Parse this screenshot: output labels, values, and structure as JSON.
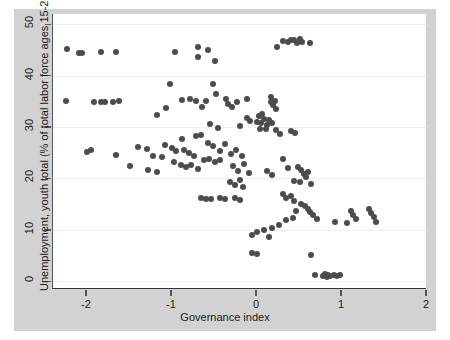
{
  "chart_data": {
    "type": "scatter",
    "title": "",
    "xlabel": "Governance index",
    "ylabel": "Unemployment, youth total (% of total labor force ages 15-24)",
    "xlim": [
      -2.4,
      2.0
    ],
    "ylim": [
      -1.5,
      52.0
    ],
    "xticks": [
      -2,
      -1,
      0,
      1,
      2
    ],
    "xtick_labels": [
      "-2",
      "-1",
      "0",
      "1",
      "2"
    ],
    "yticks": [
      0,
      10,
      20,
      30,
      40,
      50
    ],
    "ytick_labels": [
      "0",
      "10",
      "20",
      "30",
      "40",
      "50"
    ],
    "grid": "horizontal-faint",
    "legend": "none",
    "marker_color": "#4c4c4c",
    "marker_size": 6,
    "plot_background": "#ffffff",
    "figure_background": "#d2d2d2",
    "points": [
      [
        -2.23,
        45.2
      ],
      [
        -2.1,
        44.5
      ],
      [
        -2.06,
        44.4
      ],
      [
        -1.84,
        44.6
      ],
      [
        -1.66,
        44.6
      ],
      [
        -0.96,
        44.7
      ],
      [
        -0.69,
        45.6
      ],
      [
        -0.7,
        43.6
      ],
      [
        -0.58,
        44.9
      ],
      [
        -0.5,
        42.8
      ],
      [
        0.3,
        46.8
      ],
      [
        0.36,
        46.5
      ],
      [
        0.4,
        46.9
      ],
      [
        0.44,
        47.0
      ],
      [
        0.47,
        46.4
      ],
      [
        0.5,
        47.2
      ],
      [
        0.53,
        46.6
      ],
      [
        0.24,
        45.6
      ],
      [
        0.62,
        46.4
      ],
      [
        -1.02,
        38.4
      ],
      [
        -0.52,
        38.3
      ],
      [
        -0.48,
        36.4
      ],
      [
        -2.25,
        35.0
      ],
      [
        -1.92,
        34.9
      ],
      [
        -1.84,
        34.9
      ],
      [
        -1.79,
        34.9
      ],
      [
        -1.7,
        34.9
      ],
      [
        -1.07,
        33.8
      ],
      [
        -0.88,
        35.2
      ],
      [
        -0.79,
        35.5
      ],
      [
        -0.72,
        35.1
      ],
      [
        -0.36,
        35.4
      ],
      [
        -0.34,
        34.5
      ],
      [
        -0.3,
        34.0
      ],
      [
        -0.23,
        34.8
      ],
      [
        -0.12,
        35.4
      ],
      [
        -0.6,
        35.0
      ],
      [
        -0.65,
        34.0
      ],
      [
        0.16,
        35.8
      ],
      [
        0.17,
        34.9
      ],
      [
        0.19,
        34.2
      ],
      [
        0.21,
        35.0
      ],
      [
        0.22,
        33.6
      ],
      [
        -1.18,
        32.3
      ],
      [
        -0.55,
        30.6
      ],
      [
        -0.2,
        30.2
      ],
      [
        0.03,
        29.6
      ],
      [
        0.4,
        29.2
      ],
      [
        -0.12,
        31.7
      ],
      [
        -0.08,
        31.2
      ],
      [
        0.0,
        31.0
      ],
      [
        0.05,
        30.8
      ],
      [
        0.08,
        31.6
      ],
      [
        0.12,
        30.5
      ],
      [
        0.14,
        31.4
      ],
      [
        0.18,
        30.8
      ],
      [
        0.06,
        32.5
      ],
      [
        0.02,
        32.1
      ],
      [
        0.1,
        29.6
      ],
      [
        0.22,
        29.5
      ],
      [
        0.27,
        28.6
      ],
      [
        0.45,
        28.9
      ],
      [
        -0.72,
        28.2
      ],
      [
        -0.66,
        28.5
      ],
      [
        -0.88,
        27.6
      ],
      [
        -0.58,
        27.0
      ],
      [
        -1.4,
        26.2
      ],
      [
        -1.3,
        25.7
      ],
      [
        -2.0,
        25.2
      ],
      [
        -1.95,
        25.5
      ],
      [
        -1.08,
        26.6
      ],
      [
        -1.0,
        26.0
      ],
      [
        -0.95,
        25.3
      ],
      [
        -0.86,
        25.6
      ],
      [
        -0.8,
        25.0
      ],
      [
        -0.74,
        24.4
      ],
      [
        -0.52,
        26.3
      ],
      [
        -0.44,
        25.4
      ],
      [
        -0.38,
        26.8
      ],
      [
        -0.31,
        24.8
      ],
      [
        -0.25,
        25.6
      ],
      [
        -0.18,
        24.3
      ],
      [
        -0.62,
        23.6
      ],
      [
        -0.56,
        23.8
      ],
      [
        -0.5,
        23.3
      ],
      [
        -0.44,
        23.5
      ],
      [
        -1.66,
        24.5
      ],
      [
        -1.22,
        24.4
      ],
      [
        -1.12,
        24.2
      ],
      [
        -0.98,
        23.2
      ],
      [
        -0.9,
        22.6
      ],
      [
        -0.84,
        22.3
      ],
      [
        -0.78,
        22.7
      ],
      [
        -0.7,
        21.9
      ],
      [
        -0.28,
        22.4
      ],
      [
        -0.22,
        21.5
      ],
      [
        -0.15,
        22.8
      ],
      [
        -0.1,
        21.0
      ],
      [
        0.3,
        23.8
      ],
      [
        0.36,
        22.0
      ],
      [
        0.12,
        21.5
      ],
      [
        0.18,
        20.6
      ],
      [
        0.48,
        22.2
      ],
      [
        0.52,
        21.6
      ],
      [
        0.55,
        20.8
      ],
      [
        0.6,
        21.2
      ],
      [
        0.58,
        20.2
      ],
      [
        0.44,
        19.6
      ],
      [
        0.5,
        19.4
      ],
      [
        0.63,
        19.0
      ],
      [
        -0.32,
        19.3
      ],
      [
        -0.26,
        18.7
      ],
      [
        -0.2,
        19.8
      ],
      [
        -0.16,
        18.4
      ],
      [
        -1.5,
        22.4
      ],
      [
        -1.28,
        21.6
      ],
      [
        -1.18,
        21.2
      ],
      [
        -0.66,
        16.2
      ],
      [
        -0.6,
        16.0
      ],
      [
        -0.54,
        16.1
      ],
      [
        -0.44,
        16.2
      ],
      [
        -0.38,
        16.0
      ],
      [
        -0.26,
        16.3
      ],
      [
        -0.2,
        15.9
      ],
      [
        0.3,
        17.0
      ],
      [
        0.34,
        16.2
      ],
      [
        0.4,
        16.6
      ],
      [
        0.44,
        15.7
      ],
      [
        0.52,
        15.0
      ],
      [
        0.56,
        14.6
      ],
      [
        0.6,
        14.0
      ],
      [
        0.62,
        13.4
      ],
      [
        0.66,
        12.8
      ],
      [
        0.7,
        12.2
      ],
      [
        0.46,
        13.6
      ],
      [
        0.42,
        12.4
      ],
      [
        0.34,
        12.0
      ],
      [
        0.26,
        11.0
      ],
      [
        0.18,
        10.4
      ],
      [
        0.08,
        10.0
      ],
      [
        0.0,
        9.6
      ],
      [
        -0.06,
        9.1
      ],
      [
        0.14,
        8.6
      ],
      [
        1.1,
        13.6
      ],
      [
        1.13,
        12.8
      ],
      [
        1.16,
        12.2
      ],
      [
        1.32,
        14.0
      ],
      [
        1.34,
        13.2
      ],
      [
        1.38,
        12.6
      ],
      [
        1.4,
        11.6
      ],
      [
        1.06,
        11.4
      ],
      [
        -0.06,
        5.6
      ],
      [
        0.0,
        5.4
      ],
      [
        0.64,
        5.2
      ],
      [
        0.68,
        1.2
      ],
      [
        0.78,
        1.0
      ],
      [
        0.8,
        1.4
      ],
      [
        0.82,
        0.9
      ],
      [
        0.84,
        1.3
      ],
      [
        0.86,
        1.1
      ],
      [
        0.9,
        1.2
      ],
      [
        0.94,
        1.0
      ],
      [
        0.98,
        1.3
      ],
      [
        -1.62,
        35.0
      ],
      [
        -0.46,
        29.8
      ],
      [
        0.92,
        11.6
      ]
    ]
  }
}
